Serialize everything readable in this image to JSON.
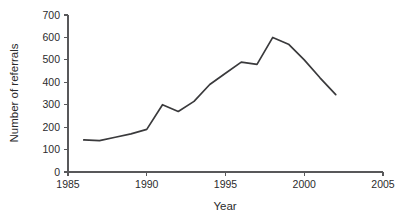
{
  "chart_data": {
    "type": "line",
    "title": "",
    "xlabel": "Year",
    "ylabel": "Number of referrals",
    "xlim": [
      1985,
      2005
    ],
    "ylim": [
      0,
      700
    ],
    "xticks": [
      1985,
      1990,
      1995,
      2000,
      2005
    ],
    "yticks": [
      0,
      100,
      200,
      300,
      400,
      500,
      600,
      700
    ],
    "grid": false,
    "legend": null,
    "series": [
      {
        "name": "Referrals",
        "color": "#3a3a3c",
        "x": [
          1986,
          1987,
          1988,
          1989,
          1990,
          1991,
          1992,
          1993,
          1994,
          1995,
          1996,
          1997,
          1998,
          1999,
          2000,
          2001,
          2002
        ],
        "values": [
          143,
          140,
          155,
          170,
          190,
          300,
          270,
          315,
          390,
          440,
          490,
          480,
          600,
          570,
          500,
          420,
          345
        ]
      }
    ]
  },
  "axes": {
    "x_title": "Year",
    "y_title": "Number of referrals",
    "x_tick_labels": [
      "1985",
      "1990",
      "1995",
      "2000",
      "2005"
    ],
    "y_tick_labels": [
      "0",
      "100",
      "200",
      "300",
      "400",
      "500",
      "600",
      "700"
    ]
  },
  "colors": {
    "line": "#3a3a3c",
    "axis": "#58585a",
    "text": "#2b2b2d",
    "background": "#ffffff"
  }
}
